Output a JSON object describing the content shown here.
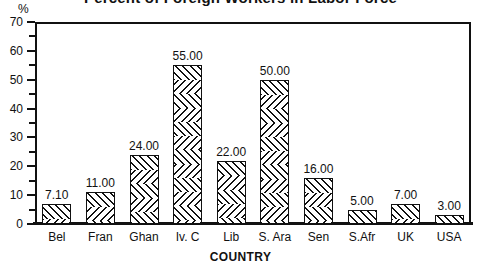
{
  "chart_data": {
    "type": "bar",
    "title": "Percent of Foreign Workers in Labor Force",
    "xlabel": "COUNTRY",
    "ylabel": "%",
    "categories": [
      "Bel",
      "Fran",
      "Ghan",
      "Iv. C",
      "Lib",
      "S. Ara",
      "Sen",
      "S.Afr",
      "UK",
      "USA"
    ],
    "values": [
      7.1,
      11.0,
      24.0,
      55.0,
      22.0,
      50.0,
      16.0,
      5.0,
      7.0,
      3.0
    ],
    "value_labels": [
      "7.10",
      "11.00",
      "24.00",
      "55.00",
      "22.00",
      "50.00",
      "16.00",
      "5.00",
      "7.00",
      "3.00"
    ],
    "ylim": [
      0,
      70
    ],
    "ymajor_ticks": [
      0,
      10,
      20,
      30,
      40,
      50,
      60,
      70
    ],
    "ymajor_tick_labels": [
      "0",
      "10",
      "20",
      "30",
      "40",
      "50",
      "60",
      "70"
    ],
    "yminor_ticks": [
      5,
      15,
      25,
      35,
      45,
      55,
      65
    ],
    "grid": false,
    "legend": false,
    "bar_fill": "diagonal-crosshatch",
    "bar_color": "#111111",
    "background": "#ffffff"
  }
}
